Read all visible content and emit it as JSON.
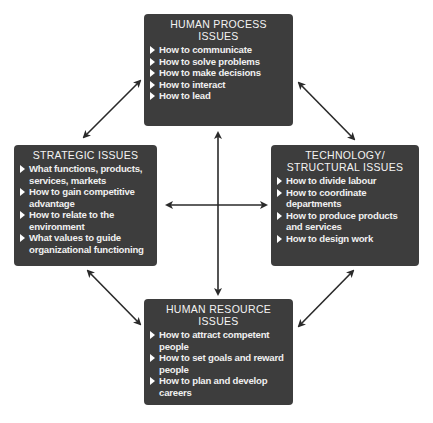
{
  "diagram": {
    "boxes": {
      "top": {
        "title_line1": "HUMAN PROCESS",
        "title_line2": "ISSUES",
        "items": [
          "How to communicate",
          "How to solve problems",
          "How to make decisions",
          "How to interact",
          "How to lead"
        ]
      },
      "left": {
        "title_line1": "STRATEGIC ISSUES",
        "items": [
          "What functions, products, services, markets",
          "How to gain competitive advantage",
          "How to relate to the environment",
          "What values to guide organizational functioning"
        ]
      },
      "right": {
        "title_line1": "TECHNOLOGY/",
        "title_line2": "STRUCTURAL ISSUES",
        "items": [
          "How to divide labour",
          "How to coordinate departments",
          "How to produce products and services",
          "How to design work"
        ]
      },
      "bottom": {
        "title_line1": "HUMAN RESOURCE",
        "title_line2": "ISSUES",
        "items": [
          "How to attract competent people",
          "How to set goals and reward people",
          "How to plan and develop careers"
        ]
      }
    },
    "connections": [
      {
        "from": "top",
        "to": "left",
        "type": "double-arrow"
      },
      {
        "from": "top",
        "to": "right",
        "type": "double-arrow"
      },
      {
        "from": "bottom",
        "to": "left",
        "type": "double-arrow"
      },
      {
        "from": "bottom",
        "to": "right",
        "type": "double-arrow"
      },
      {
        "from": "top",
        "to": "bottom",
        "type": "double-arrow"
      },
      {
        "from": "left",
        "to": "right",
        "type": "double-arrow"
      }
    ],
    "colors": {
      "box_fill": "#3d3d3d",
      "box_text": "#f2f2f2",
      "arrow": "#2a2a2a",
      "background": "#ffffff"
    }
  }
}
